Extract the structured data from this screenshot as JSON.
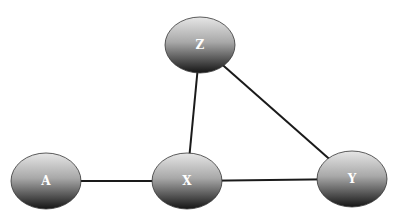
{
  "diagram": {
    "type": "graph",
    "nodes": [
      {
        "id": "Z",
        "label": "Z"
      },
      {
        "id": "A",
        "label": "A"
      },
      {
        "id": "X",
        "label": "X"
      },
      {
        "id": "Y",
        "label": "Y"
      }
    ],
    "edges": [
      {
        "from": "A",
        "to": "X"
      },
      {
        "from": "X",
        "to": "Y"
      },
      {
        "from": "X",
        "to": "Z"
      },
      {
        "from": "Z",
        "to": "Y"
      }
    ],
    "colors": {
      "node_light": "#d8d8d8",
      "node_dark": "#1e1e1e",
      "edge": "#1a1a1a"
    }
  }
}
